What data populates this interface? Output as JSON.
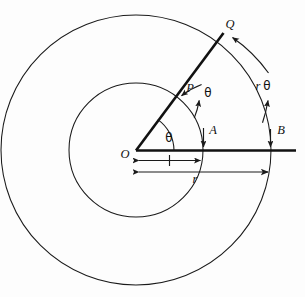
{
  "figure": {
    "background_color": "#fdfdfd",
    "ink_color": "#111111",
    "labels": {
      "origin": "O",
      "inner_ray_point": "P",
      "outer_ray_point": "Q",
      "inner_axis_point": "A",
      "outer_axis_point": "B",
      "angle_vertex": "θ",
      "inner_arc": "θ",
      "outer_arc_radius": "r",
      "outer_arc_angle": "θ",
      "dim_arc_length": "l",
      "dim_radius": "r"
    },
    "geometry": {
      "center_x": 136,
      "center_y": 150,
      "inner_radius": 67,
      "outer_radius": 135,
      "ray_angle_degrees": 55,
      "axis_end_x": 296
    }
  }
}
